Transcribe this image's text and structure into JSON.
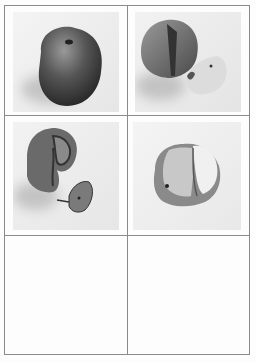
{
  "sheet": {
    "layout": {
      "columns": 2,
      "rows": 3
    },
    "panels": [
      {
        "position": "row1-col1",
        "content": "whole apple"
      },
      {
        "position": "row1-col2",
        "content": "apple with wedge cut out, wedge beside it"
      },
      {
        "position": "row2-col1",
        "content": "cut apple with browning, wedge separated"
      },
      {
        "position": "row2-col2",
        "content": "apple with exposed flesh, heavily browned"
      },
      {
        "position": "row3-col1",
        "content": ""
      },
      {
        "position": "row3-col2",
        "content": ""
      }
    ],
    "colors": {
      "line": "#8a8a8a",
      "background": "#fdfdfd"
    }
  }
}
